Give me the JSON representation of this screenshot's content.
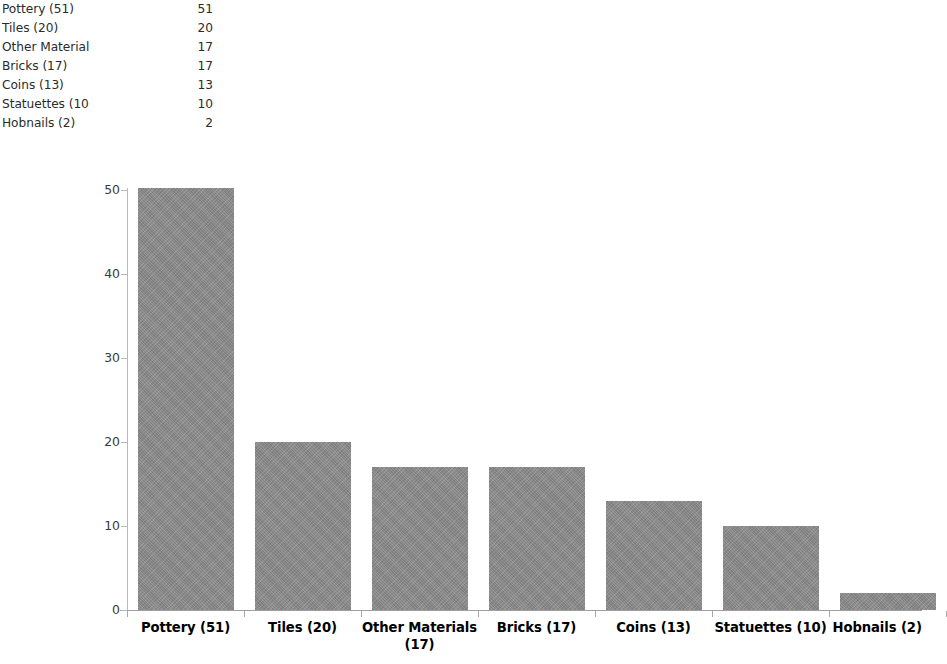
{
  "table": {
    "rows": [
      {
        "label": "Pottery (51)",
        "value": "51"
      },
      {
        "label": "Tiles (20)",
        "value": "20"
      },
      {
        "label": "Other Material",
        "value": "17"
      },
      {
        "label": "Bricks (17)",
        "value": "17"
      },
      {
        "label": "Coins (13)",
        "value": "13"
      },
      {
        "label": "Statuettes (10",
        "value": "10"
      },
      {
        "label": "Hobnails (2)",
        "value": "2"
      }
    ]
  },
  "chart_data": {
    "type": "bar",
    "title": "",
    "xlabel": "",
    "ylabel": "",
    "ylim": [
      0,
      50
    ],
    "yticks": [
      "0",
      "10",
      "20",
      "30",
      "40",
      "50"
    ],
    "grid": false,
    "legend": false,
    "bar_color": "#8a8a8a",
    "categories": [
      "Pottery (51)",
      "Tiles (20)",
      "Other Materials (17)",
      "Bricks (17)",
      "Coins (13)",
      "Statuettes (10)",
      "Hobnails (2)"
    ],
    "values": [
      51,
      20,
      17,
      17,
      13,
      10,
      2
    ]
  }
}
